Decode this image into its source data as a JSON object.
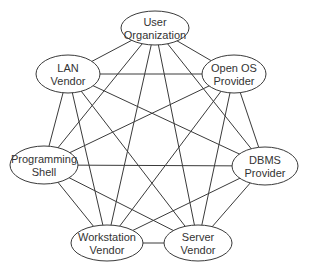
{
  "diagram": {
    "type": "complete-graph",
    "colors": {
      "stroke": "#3a3a3a",
      "text": "#333333",
      "background": "#ffffff"
    },
    "nodes": [
      {
        "id": "user-organization",
        "line1": "User",
        "line2": "Organization",
        "cx": 155,
        "cy": 28,
        "rx": 34,
        "ry": 17
      },
      {
        "id": "lan-vendor",
        "line1": "LAN",
        "line2": "Vendor",
        "cx": 68,
        "cy": 74,
        "rx": 32,
        "ry": 19
      },
      {
        "id": "open-os-provider",
        "line1": "Open OS",
        "line2": "Provider",
        "cx": 234,
        "cy": 74,
        "rx": 32,
        "ry": 19
      },
      {
        "id": "programming-shell",
        "line1": "Programming",
        "line2": "Shell",
        "cx": 44,
        "cy": 165,
        "rx": 34,
        "ry": 19
      },
      {
        "id": "dbms-provider",
        "line1": "DBMS",
        "line2": "Provider",
        "cx": 265,
        "cy": 166,
        "rx": 33,
        "ry": 19
      },
      {
        "id": "workstation-vendor",
        "line1": "Workstation",
        "line2": "Vendor",
        "cx": 107,
        "cy": 243,
        "rx": 36,
        "ry": 18
      },
      {
        "id": "server-vendor",
        "line1": "Server",
        "line2": "Vendor",
        "cx": 198,
        "cy": 243,
        "rx": 34,
        "ry": 18
      }
    ],
    "edges": [
      [
        "user-organization",
        "lan-vendor"
      ],
      [
        "user-organization",
        "open-os-provider"
      ],
      [
        "user-organization",
        "programming-shell"
      ],
      [
        "user-organization",
        "dbms-provider"
      ],
      [
        "user-organization",
        "workstation-vendor"
      ],
      [
        "user-organization",
        "server-vendor"
      ],
      [
        "lan-vendor",
        "open-os-provider"
      ],
      [
        "lan-vendor",
        "programming-shell"
      ],
      [
        "lan-vendor",
        "dbms-provider"
      ],
      [
        "lan-vendor",
        "workstation-vendor"
      ],
      [
        "lan-vendor",
        "server-vendor"
      ],
      [
        "open-os-provider",
        "programming-shell"
      ],
      [
        "open-os-provider",
        "dbms-provider"
      ],
      [
        "open-os-provider",
        "workstation-vendor"
      ],
      [
        "open-os-provider",
        "server-vendor"
      ],
      [
        "programming-shell",
        "dbms-provider"
      ],
      [
        "programming-shell",
        "workstation-vendor"
      ],
      [
        "programming-shell",
        "server-vendor"
      ],
      [
        "dbms-provider",
        "workstation-vendor"
      ],
      [
        "dbms-provider",
        "server-vendor"
      ],
      [
        "workstation-vendor",
        "server-vendor"
      ]
    ]
  }
}
